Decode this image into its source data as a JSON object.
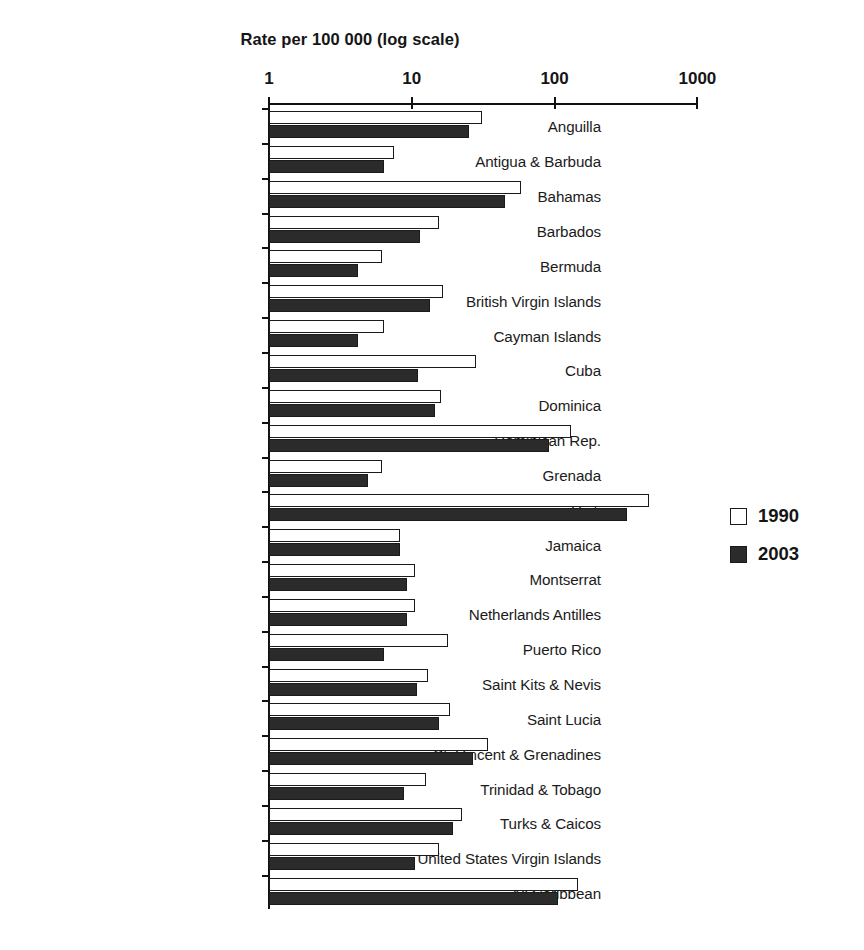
{
  "chart_data": {
    "type": "bar",
    "orientation": "horizontal",
    "title": "Rate per 100 000 (log scale)",
    "xlabel": "Rate per 100 000 (log scale)",
    "ylabel": "",
    "scale": "log",
    "xlim": [
      1,
      1000
    ],
    "xticks": [
      1,
      10,
      100,
      1000
    ],
    "xtick_labels": [
      "1",
      "10",
      "100",
      "1000"
    ],
    "grid": false,
    "legend_position": "right",
    "categories": [
      "Anguilla",
      "Antigua & Barbuda",
      "Bahamas",
      "Barbados",
      "Bermuda",
      "British Virgin Islands",
      "Cayman Islands",
      "Cuba",
      "Dominica",
      "Dominican Rep.",
      "Grenada",
      "Haiti",
      "Jamaica",
      "Montserrat",
      "Netherlands Antilles",
      "Puerto Rico",
      "Saint Kits & Nevis",
      "Saint Lucia",
      "St. Vincent & Grenadines",
      "Trinidad & Tobago",
      "Turks & Caicos",
      "United States Virgin Islands",
      "All Caribbean"
    ],
    "series": [
      {
        "name": "1990",
        "color": "#ffffff",
        "values": [
          31,
          7.5,
          58,
          15.5,
          6.2,
          16.5,
          6.4,
          28,
          16,
          130,
          6.2,
          460,
          8.3,
          10.5,
          10.5,
          18,
          13,
          18.5,
          34,
          12.5,
          22.5,
          15.5,
          145
        ]
      },
      {
        "name": "2003",
        "color": "#2b2b2b",
        "values": [
          25,
          6.4,
          45,
          11.5,
          4.2,
          13.5,
          4.2,
          11,
          14.5,
          92,
          4.9,
          320,
          8.3,
          9.3,
          9.3,
          6.4,
          10.8,
          15.5,
          27,
          8.8,
          19.5,
          10.5,
          105
        ]
      }
    ],
    "legend_entries": [
      "1990",
      "2003"
    ]
  },
  "axis": {
    "title": "Rate per 100 000 (log scale)",
    "ticks": [
      "1",
      "10",
      "100",
      "1000"
    ]
  },
  "legend": {
    "items": [
      {
        "label": "1990",
        "swatch": "open-square-icon"
      },
      {
        "label": "2003",
        "swatch": "filled-square-icon"
      }
    ]
  },
  "caption": {
    "text": ""
  }
}
